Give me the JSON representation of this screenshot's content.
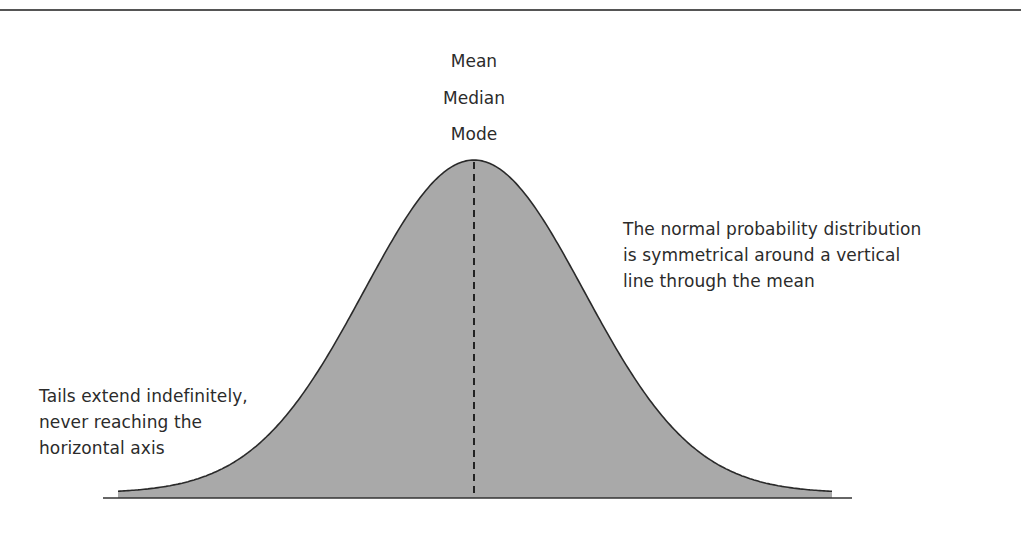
{
  "diagram": {
    "title": "Normal probability distribution",
    "center_labels": [
      "Mean",
      "Median",
      "Mode"
    ],
    "annotations": {
      "right": {
        "lines": [
          "The normal probability distribution",
          "is symmetrical around a vertical",
          "line through the mean"
        ]
      },
      "left": {
        "lines": [
          "Tails extend indefinitely,",
          "never reaching the",
          "horizontal axis"
        ]
      }
    },
    "colors": {
      "fill": "#a9a9a9",
      "curve_stroke": "#2a2a2a",
      "axis": "#333333",
      "mean_line": "#222222",
      "top_rule": "#555555"
    },
    "geometry": {
      "mean_x": 474,
      "peak_y": 160,
      "tail_y": 493,
      "sigma_px": 110,
      "curve_x_start": 118,
      "curve_x_end": 832,
      "axis_y": 498,
      "axis_x_start": 103,
      "axis_x_end": 852
    }
  }
}
